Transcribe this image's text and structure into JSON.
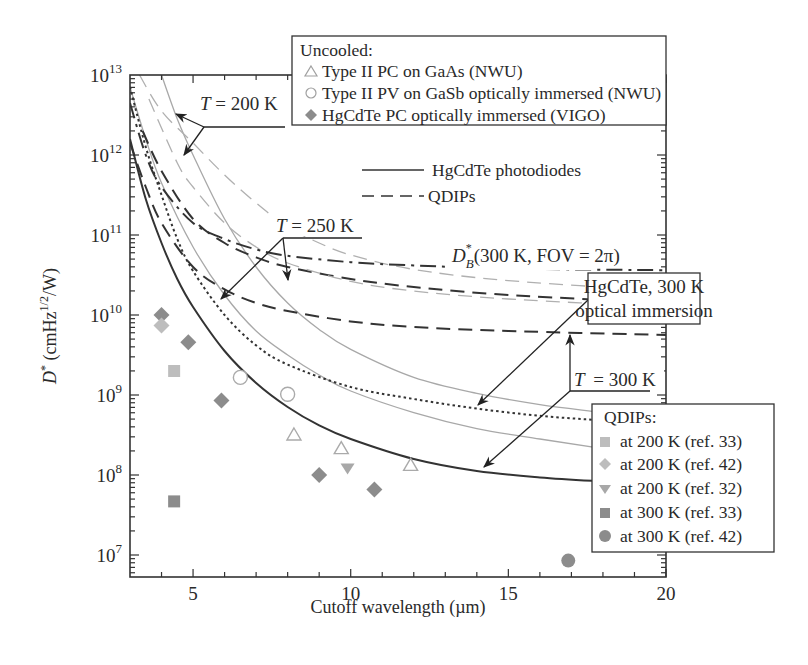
{
  "chart_data": {
    "type": "line",
    "title": "",
    "xlabel": "Cutoff wavelength (µm)",
    "ylabel": "D* (cmHz^1/2/W)",
    "ylabel_parts": {
      "main": "D",
      "star": "*",
      "unit_pre": " (cmHz",
      "unit_sup": "1/2",
      "unit_post": "/W)"
    },
    "xlim": [
      3,
      20
    ],
    "ylim_log10": [
      6.73,
      13
    ],
    "yscale": "log",
    "x_ticks": [
      5,
      10,
      15,
      20
    ],
    "y_ticks": [
      {
        "base": "10",
        "exp": "7",
        "log": 7
      },
      {
        "base": "10",
        "exp": "8",
        "log": 8
      },
      {
        "base": "10",
        "exp": "9",
        "log": 9
      },
      {
        "base": "10",
        "exp": "10",
        "log": 10
      },
      {
        "base": "10",
        "exp": "11",
        "log": 11
      },
      {
        "base": "10",
        "exp": "12",
        "log": 12
      },
      {
        "base": "10",
        "exp": "13",
        "log": 13
      }
    ],
    "grid": false,
    "series": [
      {
        "name": "HgCdTe photodiodes T=300 K",
        "style": "solid",
        "color": "#333333",
        "width": 2,
        "points": [
          [
            3,
            12.2
          ],
          [
            3.5,
            11.45
          ],
          [
            4,
            10.9
          ],
          [
            4.5,
            10.45
          ],
          [
            5,
            10.1
          ],
          [
            6,
            9.55
          ],
          [
            7,
            9.15
          ],
          [
            8,
            8.85
          ],
          [
            9,
            8.62
          ],
          [
            10,
            8.45
          ],
          [
            12,
            8.2
          ],
          [
            14,
            8.05
          ],
          [
            16,
            7.97
          ],
          [
            18,
            7.92
          ],
          [
            20,
            7.88
          ]
        ]
      },
      {
        "name": "HgCdTe photodiodes T=250 K",
        "style": "solid",
        "color": "#a8a8a8",
        "width": 1.3,
        "points": [
          [
            3,
            12.85
          ],
          [
            3.5,
            12.2
          ],
          [
            4,
            11.65
          ],
          [
            5,
            10.85
          ],
          [
            6,
            10.25
          ],
          [
            7,
            9.8
          ],
          [
            8,
            9.5
          ],
          [
            9,
            9.25
          ],
          [
            10,
            9.05
          ],
          [
            12,
            8.78
          ],
          [
            14,
            8.58
          ],
          [
            16,
            8.45
          ],
          [
            18,
            8.33
          ],
          [
            20,
            8.22
          ]
        ]
      },
      {
        "name": "HgCdTe photodiodes T=200 K",
        "style": "solid",
        "color": "#a8a8a8",
        "width": 1.3,
        "points": [
          [
            4.0,
            13
          ],
          [
            4.5,
            12.45
          ],
          [
            5,
            12.0
          ],
          [
            6,
            11.2
          ],
          [
            7,
            10.6
          ],
          [
            8,
            10.15
          ],
          [
            9,
            9.82
          ],
          [
            10,
            9.57
          ],
          [
            12,
            9.22
          ],
          [
            14,
            9.02
          ],
          [
            16,
            8.88
          ],
          [
            18,
            8.78
          ],
          [
            20,
            8.68
          ]
        ]
      },
      {
        "name": "HgCdTe 300 K optical immersion",
        "style": "dotted",
        "color": "#333333",
        "width": 2,
        "points": [
          [
            3,
            12.85
          ],
          [
            3.5,
            12.1
          ],
          [
            4,
            11.5
          ],
          [
            4.5,
            10.95
          ],
          [
            5,
            10.55
          ],
          [
            6,
            10.0
          ],
          [
            7,
            9.62
          ],
          [
            8,
            9.38
          ],
          [
            10,
            9.1
          ],
          [
            12,
            8.95
          ],
          [
            14,
            8.83
          ],
          [
            16,
            8.74
          ],
          [
            18,
            8.68
          ],
          [
            20,
            8.62
          ]
        ]
      },
      {
        "name": "QDIPs T=300 K",
        "style": "dashed",
        "color": "#333333",
        "width": 2,
        "points": [
          [
            3,
            12.15
          ],
          [
            3.5,
            11.6
          ],
          [
            4,
            11.15
          ],
          [
            5,
            10.6
          ],
          [
            6,
            10.32
          ],
          [
            7,
            10.15
          ],
          [
            8,
            10.05
          ],
          [
            10,
            9.92
          ],
          [
            12,
            9.85
          ],
          [
            15,
            9.8
          ],
          [
            20,
            9.75
          ]
        ]
      },
      {
        "name": "QDIPs T=250 K",
        "style": "dashed",
        "color": "#333333",
        "width": 2,
        "points": [
          [
            3.4,
            12.3
          ],
          [
            4,
            11.8
          ],
          [
            5,
            11.2
          ],
          [
            6,
            10.9
          ],
          [
            7,
            10.72
          ],
          [
            8,
            10.6
          ],
          [
            10,
            10.45
          ],
          [
            12,
            10.35
          ],
          [
            15,
            10.25
          ],
          [
            20,
            10.15
          ]
        ]
      },
      {
        "name": "QDIPs T=250 K (light)",
        "style": "dashed",
        "color": "#b0b0b0",
        "width": 1.3,
        "points": [
          [
            3.6,
            12.7
          ],
          [
            4.5,
            11.9
          ],
          [
            5,
            11.6
          ],
          [
            6,
            11.15
          ],
          [
            7,
            10.85
          ],
          [
            8,
            10.65
          ],
          [
            10,
            10.42
          ],
          [
            12,
            10.3
          ],
          [
            15,
            10.2
          ],
          [
            20,
            10.1
          ]
        ]
      },
      {
        "name": "QDIPs T=200 K",
        "style": "dashed",
        "color": "#b0b0b0",
        "width": 1.3,
        "points": [
          [
            3.3,
            13
          ],
          [
            4,
            12.55
          ],
          [
            5,
            12.15
          ],
          [
            6,
            11.75
          ],
          [
            7,
            11.4
          ],
          [
            8,
            11.1
          ],
          [
            9,
            10.9
          ],
          [
            10,
            10.75
          ],
          [
            12,
            10.57
          ],
          [
            15,
            10.43
          ],
          [
            20,
            10.3
          ]
        ]
      },
      {
        "name": "D*B (300 K, FOV = 2π)",
        "style": "dashdot",
        "color": "#333333",
        "width": 2,
        "points": [
          [
            3,
            12.65
          ],
          [
            3.5,
            12.0
          ],
          [
            4,
            11.6
          ],
          [
            5,
            11.15
          ],
          [
            6,
            10.95
          ],
          [
            7,
            10.82
          ],
          [
            8,
            10.74
          ],
          [
            10,
            10.66
          ],
          [
            12,
            10.62
          ],
          [
            15,
            10.58
          ],
          [
            20,
            10.56
          ]
        ]
      }
    ],
    "markers": [
      {
        "group": "Uncooled: Type II PC on GaAs (NWU)",
        "shape": "triangle-open",
        "color": "#aaaaaa",
        "points": [
          [
            8.2,
            8.5
          ],
          [
            9.7,
            8.33
          ],
          [
            11.9,
            8.12
          ]
        ]
      },
      {
        "group": "Uncooled: Type II PV on GaSb optically immersed (NWU)",
        "shape": "circle-open",
        "color": "#aaaaaa",
        "points": [
          [
            6.5,
            9.22
          ],
          [
            8.0,
            9.01
          ]
        ]
      },
      {
        "group": "Uncooled: HgCdTe PC optically immersed (VIGO)",
        "shape": "diamond",
        "color": "#8c8c8c",
        "points": [
          [
            4.0,
            10.0
          ],
          [
            4.85,
            9.66
          ],
          [
            5.9,
            8.93
          ],
          [
            9.0,
            8.0
          ],
          [
            10.75,
            7.82
          ]
        ]
      },
      {
        "group": "QDIPs at 200 K (ref. 33)",
        "shape": "square",
        "color": "#bdbdbd",
        "points": [
          [
            4.4,
            9.3
          ]
        ]
      },
      {
        "group": "QDIPs at 200 K (ref. 42)",
        "shape": "diamond",
        "color": "#bdbdbd",
        "points": [
          [
            4.0,
            9.87
          ]
        ]
      },
      {
        "group": "QDIPs at 200 K (ref. 32)",
        "shape": "triangle-down",
        "color": "#a8a8a8",
        "points": [
          [
            9.9,
            8.08
          ]
        ]
      },
      {
        "group": "QDIPs at 300 K (ref. 33)",
        "shape": "square",
        "color": "#8c8c8c",
        "points": [
          [
            4.4,
            7.67
          ]
        ]
      },
      {
        "group": "QDIPs at 300 K (ref. 42)",
        "shape": "circle",
        "color": "#8c8c8c",
        "points": [
          [
            16.9,
            6.93
          ]
        ]
      }
    ],
    "legend_top": {
      "title": "Uncooled:",
      "items": [
        {
          "shape": "triangle-open",
          "label": "Type II PC on GaAs (NWU)"
        },
        {
          "shape": "circle-open",
          "label": "Type II PV on GaSb optically immersed (NWU)"
        },
        {
          "shape": "diamond",
          "label": "HgCdTe PC optically immersed (VIGO)"
        }
      ]
    },
    "legend_lines": [
      {
        "style": "solid",
        "label": "HgCdTe photodiodes"
      },
      {
        "style": "dashed",
        "label": "QDIPs"
      }
    ],
    "legend_bottom": {
      "title": "QDIPs:",
      "items": [
        {
          "shape": "square",
          "color": "#bdbdbd",
          "label": "at 200 K (ref. 33)"
        },
        {
          "shape": "diamond",
          "color": "#bdbdbd",
          "label": "at 200 K (ref. 42)"
        },
        {
          "shape": "triangle-down",
          "color": "#a8a8a8",
          "label": "at 200 K (ref. 32)"
        },
        {
          "shape": "square",
          "color": "#8c8c8c",
          "label": "at 300 K (ref. 33)"
        },
        {
          "shape": "circle",
          "color": "#8c8c8c",
          "label": "at 300 K (ref. 42)"
        }
      ]
    },
    "annotations": [
      {
        "text_T": "T",
        "text_rest": " = 200 K",
        "label": "T = 200 K"
      },
      {
        "text_T": "T",
        "text_rest": " = 250 K",
        "label": "T = 250 K"
      },
      {
        "text_T": "T",
        "text_rest": " = 300 K",
        "label": "T = 300 K"
      },
      {
        "label": "D*B(300 K, FOV = 2π)",
        "main": "D",
        "sup": "*",
        "sub": "B",
        "rest": "(300 K, FOV = 2π)"
      },
      {
        "line1": "HgCdTe, 300 K",
        "line2": "optical immersion"
      }
    ]
  }
}
